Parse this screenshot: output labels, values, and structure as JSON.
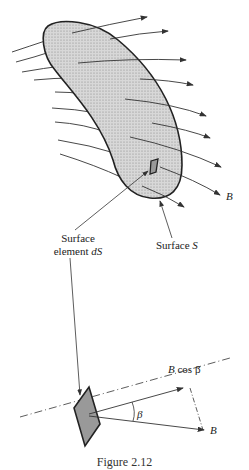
{
  "diagram": {
    "top": {
      "surface_label": "Surface S",
      "surface_label_prefix": "Surface",
      "surface_label_var": "S",
      "element_label_line1": "Surface",
      "element_label_line2_prefix": "element",
      "element_label_line2_var": "dS",
      "field_label": "B"
    },
    "bottom": {
      "projection_label_var": "B",
      "projection_label_suffix": "cos β",
      "angle_label": "β",
      "field_label": "B"
    },
    "caption": "Figure 2.12",
    "colors": {
      "surface_fill": "#e6e6e6",
      "outline": "#222222",
      "lines": "#333333",
      "element_fill": "#a8a8a8"
    }
  }
}
